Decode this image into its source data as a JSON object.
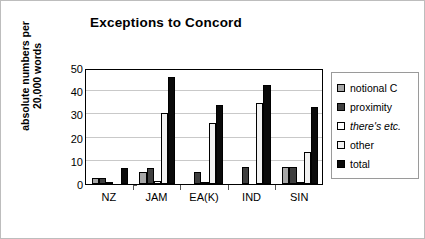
{
  "chart_data": {
    "type": "bar",
    "title": "Exceptions to Concord",
    "xlabel": "",
    "ylabel": "absolute numbers per\n20,000 words",
    "categories": [
      "NZ",
      "JAM",
      "EA(K)",
      "IND",
      "SIN"
    ],
    "ylim": [
      0,
      50
    ],
    "yticks": [
      0,
      10,
      20,
      30,
      40,
      50
    ],
    "grid": true,
    "legend_position": "right",
    "series": [
      {
        "name": "notional C",
        "color": "#a6a6a6",
        "values": [
          2.5,
          5.3,
          0.0,
          0.0,
          7.3
        ]
      },
      {
        "name": "proximity",
        "color": "#3f3f3f",
        "values": [
          2.5,
          6.8,
          5.2,
          7.5,
          7.3
        ]
      },
      {
        "name": "there's etc.",
        "color": "#ffffff",
        "italic": true,
        "values": [
          0.7,
          1.5,
          0.6,
          0.0,
          1.0
        ]
      },
      {
        "name": "other",
        "color": "#f2f2f2",
        "values": [
          0.0,
          30.7,
          26.5,
          35.0,
          14.0
        ]
      },
      {
        "name": "total",
        "color": "#0a0a0a",
        "values": [
          7.0,
          46.0,
          34.0,
          42.5,
          33.0
        ]
      }
    ]
  }
}
